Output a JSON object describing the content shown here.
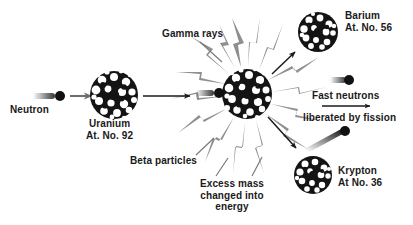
{
  "diagram": {
    "background_color": "#ffffff",
    "ray_color": "#8f8f8f",
    "arrow_color": "#1a1a1a",
    "nucleus_color": "#141414",
    "labels": {
      "neutron": "Neutron",
      "uranium_name": "Uranium",
      "uranium_number": "At. No. 92",
      "gamma_rays": "Gamma rays",
      "beta_particles": "Beta particles",
      "excess_line1": "Excess mass",
      "excess_line2": "changed into",
      "excess_line3": "energy",
      "barium_name": "Barium",
      "barium_number": "At. No. 56",
      "fast_neutrons": "Fast  neutrons",
      "liberated": "liberated by fission",
      "krypton_name": "Krypton",
      "krypton_number": "At No. 36"
    }
  }
}
